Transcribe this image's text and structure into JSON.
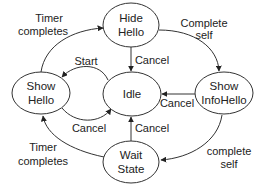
{
  "diagram": {
    "type": "state-machine",
    "nodes": {
      "hide_hello": {
        "line1": "Hide",
        "line2": "Hello"
      },
      "idle": {
        "line1": "Idle"
      },
      "wait_state": {
        "line1": "Wait",
        "line2": "State"
      },
      "show_infohello": {
        "line1": "Show",
        "line2": "InfoHello"
      },
      "show_hello": {
        "line1": "Show",
        "line2": "Hello"
      }
    },
    "edges": {
      "hide_to_showinfo": {
        "line1": "Complete",
        "line2": "self"
      },
      "showinfo_to_wait": {
        "line1": "complete",
        "line2": "self"
      },
      "wait_to_showhello": {
        "line1": "Timer",
        "line2": "completes"
      },
      "showhello_to_hide": {
        "line1": "Timer",
        "line2": "completes"
      },
      "idle_to_showhello": {
        "label": "Start"
      },
      "showhello_to_idle": {
        "label": "Cancel"
      },
      "hide_to_idle": {
        "label": "Cancel"
      },
      "wait_to_idle": {
        "label": "Cancel"
      },
      "showinfo_to_idle": {
        "label": "Cancel"
      }
    },
    "colors": {
      "stroke": "#333333",
      "text": "#222222",
      "background": "#ffffff"
    }
  }
}
